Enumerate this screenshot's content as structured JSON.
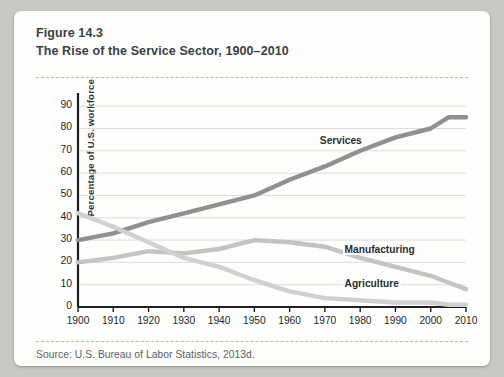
{
  "figure": {
    "number": "Figure 14.3",
    "title": "The Rise of the Service Sector, 1900–2010",
    "source": "Source: U.S. Bureau of Labor Statistics, 2013d."
  },
  "colors": {
    "card": "#fdfdfb",
    "page": "#c9c9c4",
    "services": "#8f9094",
    "manufacturing": "#c2c3c5",
    "agriculture": "#cfd0d2",
    "axis": "#1b1e22",
    "grid": "#dcdcd9",
    "title_text": "#3b3f46"
  },
  "chart_data": {
    "type": "line",
    "title": "The Rise of the Service Sector, 1900–2010",
    "xlabel": "",
    "ylabel": "Percentage of U.S. workforce",
    "xlim": [
      1900,
      2010
    ],
    "ylim": [
      0,
      95
    ],
    "yticks": [
      0,
      10,
      20,
      30,
      40,
      50,
      60,
      70,
      80,
      90
    ],
    "xticks": [
      1900,
      1910,
      1920,
      1930,
      1940,
      1950,
      1960,
      1970,
      1980,
      1990,
      2000,
      2010
    ],
    "grid": true,
    "legend": "inline-labels",
    "x": [
      1900,
      1910,
      1920,
      1930,
      1940,
      1950,
      1960,
      1970,
      1980,
      1990,
      2000,
      2005,
      2010
    ],
    "series": [
      {
        "name": "Services",
        "color": "#8f9094",
        "label_x": 1968,
        "label_y": 74,
        "values": [
          30,
          33,
          38,
          42,
          46,
          50,
          57,
          63,
          70,
          76,
          80,
          85,
          85
        ]
      },
      {
        "name": "Manufacturing",
        "color": "#c2c3c5",
        "label_x": 1975,
        "label_y": 25,
        "values": [
          20,
          22,
          25,
          24,
          26,
          30,
          29,
          27,
          22,
          18,
          14,
          11,
          8
        ]
      },
      {
        "name": "Agriculture",
        "color": "#cfd0d2",
        "label_x": 1975,
        "label_y": 10,
        "values": [
          42,
          36,
          29,
          22,
          18,
          12,
          7,
          4,
          3,
          2,
          2,
          1,
          1
        ]
      }
    ]
  }
}
